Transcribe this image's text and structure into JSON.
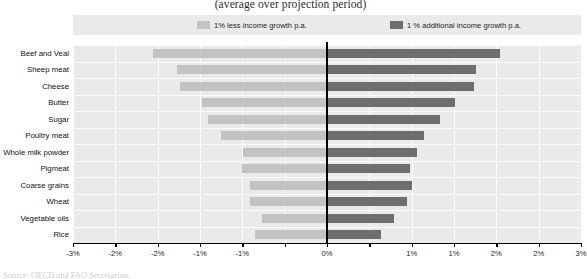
{
  "chart_data": {
    "type": "bar",
    "title": "(average over projection period)",
    "xlabel": "",
    "ylabel": "",
    "orientation": "horizontal",
    "grid": true,
    "legend_position": "top",
    "xlim": [
      -3,
      3
    ],
    "xtick_values": [
      -3,
      -2.5,
      -2,
      -1.5,
      -1,
      -0.5,
      0,
      0.5,
      1,
      1.5,
      2,
      2.5,
      3
    ],
    "xtick_labels": [
      "-3%",
      "-2%",
      "-2%",
      "-1%",
      "-1%",
      "0%",
      "1%",
      "1%",
      "2%",
      "2%",
      "3%"
    ],
    "categories": [
      "Beef and Veal",
      "Sheep meat",
      "Cheese",
      "Butter",
      "Sugar",
      "Poultry meat",
      "Whole milk powder",
      "Pigmeat",
      "Coarse grains",
      "Wheat",
      "Vegetable oils",
      "Rice"
    ],
    "series": [
      {
        "name": "1% less income growth p.a.",
        "color": "#c3c3c3",
        "values": [
          -2.05,
          -1.77,
          -1.74,
          -1.48,
          -1.4,
          -1.25,
          -0.99,
          -1.0,
          -0.91,
          -0.91,
          -0.77,
          -0.85
        ]
      },
      {
        "name": "1 % additional income growth p.a.",
        "color": "#6e6e6e",
        "values": [
          2.04,
          1.76,
          1.74,
          1.51,
          1.33,
          1.15,
          1.06,
          0.98,
          1.0,
          0.94,
          0.79,
          0.64
        ]
      }
    ]
  },
  "legend": {
    "items": [
      {
        "label": "1% less income growth p.a.",
        "color": "#c3c3c3"
      },
      {
        "label": "1 % additional income growth p.a.",
        "color": "#6e6e6e"
      }
    ]
  },
  "footer": {
    "source": "Source: OECD and FAO Secretariats."
  },
  "colors": {
    "negative_bar": "#c3c3c3",
    "positive_bar": "#6e6e6e",
    "plot_background": "#eaeaea",
    "gridline": "#fdfdfd",
    "zero_line": "#000000"
  }
}
